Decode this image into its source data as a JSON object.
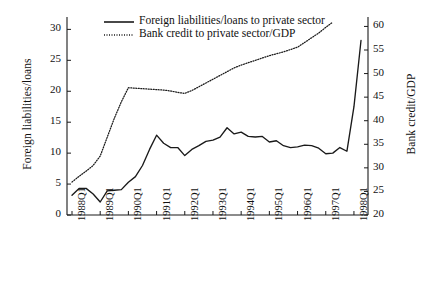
{
  "chart_data": {
    "type": "line",
    "title": "",
    "subtitle": "",
    "xlabel": "",
    "ylabel": "Foreign liabilities/loans",
    "ylabel_right": "Bank credit/GDP",
    "grid": false,
    "legend_position": "top-left",
    "ylim": [
      0,
      32
    ],
    "ylim_right": [
      20,
      62
    ],
    "yticks": [
      0,
      5,
      10,
      15,
      20,
      25,
      30
    ],
    "yticks_right": [
      20,
      25,
      30,
      35,
      40,
      45,
      50,
      55,
      60
    ],
    "xticks": [
      "1988Q1",
      "1989Q1",
      "1990Q1",
      "1991Q1",
      "1992Q1",
      "1993Q1",
      "1994Q1",
      "1995Q1",
      "1996Q1",
      "1997Q1",
      "1998Q1"
    ],
    "x": [
      "1988Q1",
      "1988Q2",
      "1988Q3",
      "1988Q4",
      "1989Q1",
      "1989Q2",
      "1989Q3",
      "1989Q4",
      "1990Q1",
      "1990Q2",
      "1990Q3",
      "1990Q4",
      "1991Q1",
      "1991Q2",
      "1991Q3",
      "1991Q4",
      "1992Q1",
      "1992Q2",
      "1992Q3",
      "1992Q4",
      "1993Q1",
      "1993Q2",
      "1993Q3",
      "1993Q4",
      "1994Q1",
      "1994Q2",
      "1994Q3",
      "1994Q4",
      "1995Q1",
      "1995Q2",
      "1995Q3",
      "1995Q4",
      "1996Q1",
      "1996Q2",
      "1996Q3",
      "1996Q4",
      "1997Q1",
      "1997Q2",
      "1997Q3",
      "1997Q4",
      "1998Q1",
      "1998Q2"
    ],
    "series": [
      {
        "name": "Foreign liabilities/loans to private sector",
        "axis": "left",
        "style": "solid",
        "color": "#1a1a1a",
        "values": [
          3.2,
          4.3,
          4.3,
          3.4,
          2.1,
          3.9,
          4.0,
          4.1,
          5.3,
          6.2,
          8.0,
          10.6,
          12.9,
          11.6,
          10.9,
          10.9,
          9.6,
          10.6,
          11.2,
          11.9,
          12.1,
          12.6,
          14.1,
          13.1,
          13.4,
          12.7,
          12.6,
          12.7,
          11.8,
          12.0,
          11.2,
          10.9,
          11.0,
          11.3,
          11.2,
          10.8,
          9.9,
          10.0,
          10.9,
          10.3,
          17.5,
          28.2
        ]
      },
      {
        "name": "Bank credit to private sector/GDP",
        "axis": "right",
        "style": "dotted",
        "color": "#1a1a1a",
        "values": [
          27.0,
          28.2,
          29.3,
          30.5,
          32.5,
          36.5,
          40.5,
          44.0,
          47.0,
          46.9,
          46.8,
          46.7,
          46.6,
          46.5,
          46.3,
          46.0,
          45.8,
          46.4,
          47.2,
          48.0,
          48.8,
          49.6,
          50.4,
          51.2,
          51.8,
          52.3,
          52.8,
          53.3,
          53.8,
          54.2,
          54.6,
          55.1,
          55.6,
          56.6,
          57.6,
          58.6,
          59.8,
          60.9,
          null,
          null,
          null,
          null
        ]
      }
    ]
  },
  "legend": {
    "items": [
      {
        "label": "Foreign liabilities/loans to private sector",
        "style": "solid"
      },
      {
        "label": "Bank credit to private sector/GDP",
        "style": "dotted"
      }
    ]
  },
  "axes": {
    "left_title": "Foreign liabilities/loans",
    "right_title": "Bank credit/GDP"
  }
}
